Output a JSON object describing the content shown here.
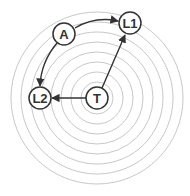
{
  "diagram": {
    "center": {
      "x": 97,
      "y": 98
    },
    "ring_radii": [
      16,
      26,
      36,
      46,
      56,
      66,
      76,
      86
    ],
    "ring_color": "#c8c8c8",
    "line_color": "#333333",
    "nodes": [
      {
        "id": "T",
        "label": "T",
        "x": 97,
        "y": 98
      },
      {
        "id": "A",
        "label": "A",
        "x": 64,
        "y": 34
      },
      {
        "id": "L1",
        "label": "L1",
        "x": 130,
        "y": 23
      },
      {
        "id": "L2",
        "label": "L2",
        "x": 40,
        "y": 98
      }
    ],
    "edges": [
      {
        "from": "A",
        "to": "L1",
        "curved": true
      },
      {
        "from": "A",
        "to": "L2",
        "curved": true
      },
      {
        "from": "T",
        "to": "L1",
        "curved": false
      },
      {
        "from": "T",
        "to": "L2",
        "curved": false
      }
    ]
  }
}
